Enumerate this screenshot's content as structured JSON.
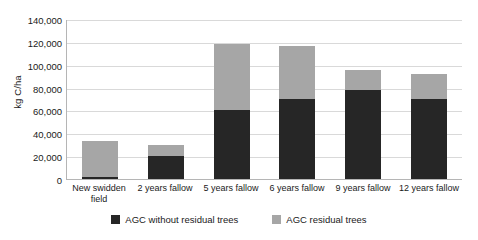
{
  "chart_data": {
    "type": "bar",
    "stacked": true,
    "title": "",
    "xlabel": "",
    "ylabel": "kg C/ha",
    "ylim": [
      0,
      140000
    ],
    "ytick_step": 20000,
    "ytick_labels": [
      "0",
      "20,000",
      "40,000",
      "60,000",
      "80,000",
      "100,000",
      "120,000",
      "140,000"
    ],
    "ytick_values": [
      0,
      20000,
      40000,
      60000,
      80000,
      100000,
      120000,
      140000
    ],
    "grid": true,
    "legend_position": "bottom",
    "categories": [
      "New swidden field",
      "2 years fallow",
      "5 years fallow",
      "6 years fallow",
      "9 years fallow",
      "12 years fallow"
    ],
    "series": [
      {
        "name": "AGC without residual trees",
        "color": "#262626",
        "values": [
          2000,
          20000,
          60000,
          70000,
          78000,
          70000
        ]
      },
      {
        "name": "AGC residual trees",
        "color": "#a6a6a6",
        "values": [
          31000,
          10000,
          58000,
          46000,
          17000,
          22000
        ]
      }
    ],
    "totals": [
      33000,
      30000,
      118000,
      116000,
      95000,
      92000
    ]
  },
  "legend": {
    "items": [
      {
        "label": "AGC without residual trees",
        "color": "#262626"
      },
      {
        "label": "AGC residual trees",
        "color": "#a6a6a6"
      }
    ]
  },
  "axes": {
    "y_title": "kg C/ha",
    "axis_line_color": "#b5b5b5",
    "gridline_color": "#d9d9d9"
  }
}
